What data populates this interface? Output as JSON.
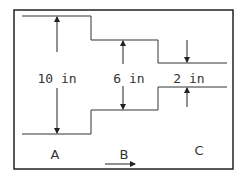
{
  "diagram": {
    "type": "pipe-reduction",
    "colors": {
      "line": "#222222",
      "text": "#333333",
      "background": "#ffffff"
    },
    "dimensions": [
      {
        "id": "A",
        "label": "10 in"
      },
      {
        "id": "B",
        "label": "6 in"
      },
      {
        "id": "C",
        "label": "2 in"
      }
    ],
    "sections": [
      {
        "label": "A"
      },
      {
        "label": "B"
      },
      {
        "label": "C"
      }
    ],
    "flow_direction": "right"
  }
}
